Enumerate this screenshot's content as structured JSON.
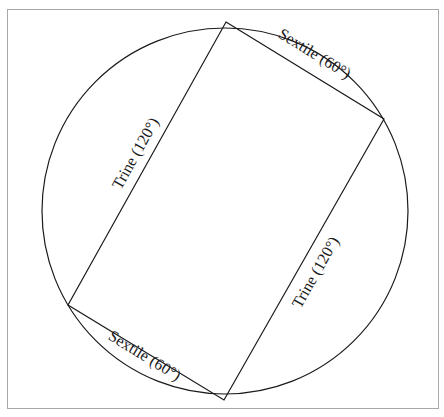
{
  "diagram": {
    "type": "astrological-aspects",
    "circle": {
      "cx": 225,
      "cy": 211,
      "r": 183
    },
    "rectangle": {
      "top": [
        226,
        22
      ],
      "right": [
        384,
        119
      ],
      "bottom": [
        224,
        400
      ],
      "left": [
        68,
        305
      ]
    },
    "labels": {
      "top_right": "Sextile (60°)",
      "bottom_left": "Sextile (60°)",
      "left": "Trine (120°)",
      "right": "Trine (120°)"
    },
    "colors": {
      "line": "#1a1a1a",
      "frame": "#a8a8a8",
      "background": "#ffffff"
    }
  }
}
